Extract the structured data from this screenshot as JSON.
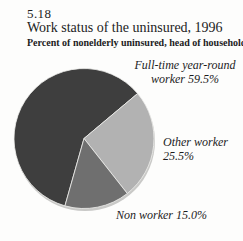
{
  "chart_data": {
    "type": "pie",
    "figure_number": "5.18",
    "title": "Work status of the uninsured, 1996",
    "subtitle": "Percent of nonelderly uninsured, head of household",
    "unit": "%",
    "start_angle_deg": 195.8,
    "legend_position": "callouts",
    "slices": [
      {
        "label": "Full-time year-round worker",
        "value": 59.5,
        "color": "#3e3e3e",
        "display": [
          "Full-time year-round",
          "worker 59.5%"
        ]
      },
      {
        "label": "Other worker",
        "value": 25.5,
        "color": "#b2b2b2",
        "display": [
          "Other worker",
          "25.5%"
        ]
      },
      {
        "label": "Non worker",
        "value": 15.0,
        "color": "#6f6f6f",
        "display": [
          "Non worker 15.0%"
        ]
      }
    ]
  },
  "colors": {
    "background": "#fdfdfc",
    "text": "#1c1c1c",
    "slice_divider": "#f0f0ee",
    "pie_shadow": "#c9c9c7"
  }
}
